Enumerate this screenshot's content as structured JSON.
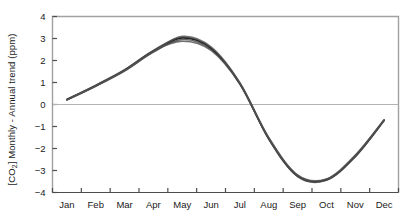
{
  "chart_data": {
    "type": "line",
    "title": "",
    "xlabel": "",
    "ylabel_parts": {
      "prefix": "[CO",
      "subscript": "2",
      "suffix": "] Monthly - Annual trend (ppm)"
    },
    "ylabel": "[CO2] Monthly - Annual trend (ppm)",
    "grid": false,
    "legend": "none",
    "zero_line": true,
    "xlim": [
      0,
      12
    ],
    "ylim": [
      -4,
      4
    ],
    "categories": [
      "Jan",
      "Feb",
      "Mar",
      "Apr",
      "May",
      "Jun",
      "Jul",
      "Aug",
      "Sep",
      "Oct",
      "Nov",
      "Dec"
    ],
    "ytick_labels": [
      "4",
      "3",
      "2",
      "1",
      "0",
      "−1",
      "−2",
      "−3",
      "−4"
    ],
    "ytick_values": [
      4,
      3,
      2,
      1,
      0,
      -1,
      -2,
      -3,
      -4
    ],
    "x_fractional": [
      0.5,
      1.5,
      2.5,
      3.5,
      4.5,
      5.5,
      6.5,
      7.5,
      8.5,
      9.5,
      10.5,
      11.5
    ],
    "series": [
      {
        "name": "ensemble-member-1",
        "color": "#231f20",
        "values": [
          0.22,
          0.85,
          1.55,
          2.42,
          3.02,
          2.55,
          0.95,
          -1.55,
          -3.25,
          -3.42,
          -2.35,
          -0.72
        ]
      },
      {
        "name": "ensemble-member-2",
        "color": "#2b2b2b",
        "values": [
          0.24,
          0.88,
          1.58,
          2.46,
          3.06,
          2.58,
          0.97,
          -1.52,
          -3.22,
          -3.4,
          -2.32,
          -0.7
        ]
      },
      {
        "name": "ensemble-member-3",
        "color": "#3a3a3a",
        "values": [
          0.2,
          0.83,
          1.52,
          2.38,
          2.95,
          2.5,
          0.93,
          -1.58,
          -3.28,
          -3.45,
          -2.38,
          -0.74
        ]
      },
      {
        "name": "ensemble-member-4",
        "color": "#4a4a4a",
        "values": [
          0.23,
          0.86,
          1.56,
          2.44,
          2.88,
          2.46,
          0.92,
          -1.56,
          -3.26,
          -3.43,
          -2.36,
          -0.73
        ]
      },
      {
        "name": "ensemble-member-5",
        "color": "#555555",
        "values": [
          0.21,
          0.84,
          1.54,
          2.4,
          3.1,
          2.62,
          0.99,
          -1.5,
          -3.2,
          -3.38,
          -2.3,
          -0.69
        ]
      }
    ],
    "annotations": [],
    "colors": {
      "frame": "#a0a0a0",
      "zero_line": "#b4b4b4",
      "curve": "#231f20",
      "text": "#1a1a1a",
      "background": "#ffffff"
    }
  }
}
